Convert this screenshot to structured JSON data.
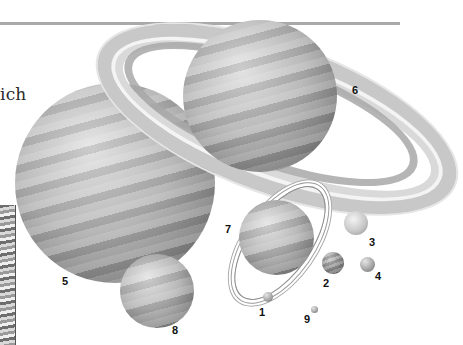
{
  "page": {
    "text_fragment": "ich",
    "figure": {
      "description": "Illustration of the planets of the solar system at relative sizes, numbered",
      "labels": [
        {
          "id": "1",
          "text": "1"
        },
        {
          "id": "2",
          "text": "2"
        },
        {
          "id": "3",
          "text": "3"
        },
        {
          "id": "4",
          "text": "4"
        },
        {
          "id": "5",
          "text": "5"
        },
        {
          "id": "6",
          "text": "6"
        },
        {
          "id": "7",
          "text": "7"
        },
        {
          "id": "8",
          "text": "8"
        },
        {
          "id": "9",
          "text": "9"
        }
      ]
    }
  },
  "colors": {
    "rule": "#a9a9a9",
    "text": "#2a2a2a",
    "label": "#111111"
  }
}
